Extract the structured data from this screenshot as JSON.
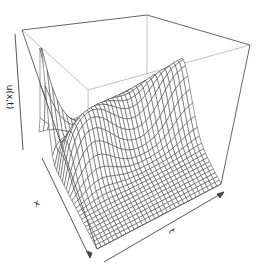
{
  "chart_data": {
    "type": "surface3d",
    "title": "",
    "xlabel": "x",
    "ylabel": "t",
    "zlabel": "u(x,t)",
    "grid": false,
    "box": true,
    "ticks": false,
    "grid_resolution": {
      "x": 30,
      "t": 30
    },
    "surface_model": {
      "x_range": [
        0,
        1
      ],
      "t_range": [
        0,
        1
      ],
      "z_range": [
        0,
        1
      ],
      "initial_peak_height": 0.95,
      "initial_peak_center_x": 0.12,
      "initial_peak_width": 0.07,
      "ridge_height": 0.42,
      "ridge_center_x": 0.35,
      "ridge_width": 0.16,
      "wave_amplitude": 0.08,
      "wave_frequency_t": 2.5,
      "base_level": 0.18
    },
    "colors": {
      "line": "#3a3a3a",
      "box": "#555555",
      "box_hidden": "#aaaaaa",
      "background": "#ffffff"
    }
  },
  "labels": {
    "x": "x",
    "t": "t",
    "u": "u(x,t)"
  }
}
